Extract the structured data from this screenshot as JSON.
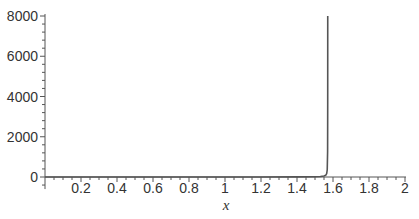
{
  "chart_data": {
    "type": "line",
    "title": "",
    "xlabel": "x",
    "ylabel": "",
    "xlim": [
      0,
      2
    ],
    "ylim": [
      -600,
      8000
    ],
    "grid": false,
    "legend": null,
    "x_ticks": [
      "0.2",
      "0.4",
      "0.6",
      "0.8",
      "1",
      "1.2",
      "1.4",
      "1.6",
      "1.8",
      "2"
    ],
    "x_tick_values": [
      0.2,
      0.4,
      0.6,
      0.8,
      1.0,
      1.2,
      1.4,
      1.6,
      1.8,
      2.0
    ],
    "y_ticks": [
      "0",
      "2000",
      "4000",
      "6000",
      "8000"
    ],
    "y_tick_values": [
      0,
      2000,
      4000,
      6000,
      8000
    ],
    "series": [
      {
        "name": "f(x)",
        "color": "#555555",
        "x": [
          0,
          0.2,
          0.4,
          0.6,
          0.8,
          1.0,
          1.2,
          1.4,
          1.5,
          1.53,
          1.55,
          1.56,
          1.565,
          1.568,
          1.57,
          1.5706,
          1.5708
        ],
        "y": [
          0,
          0.2,
          0.42,
          0.68,
          1.03,
          1.56,
          2.57,
          5.8,
          14.1,
          24.5,
          48.1,
          92.6,
          172.5,
          358.8,
          1255.8,
          3600,
          8000
        ]
      }
    ]
  },
  "axes": {
    "x_label": "x",
    "colors": {
      "axis": "#555555",
      "curve": "#555555",
      "text": "#333333"
    }
  }
}
